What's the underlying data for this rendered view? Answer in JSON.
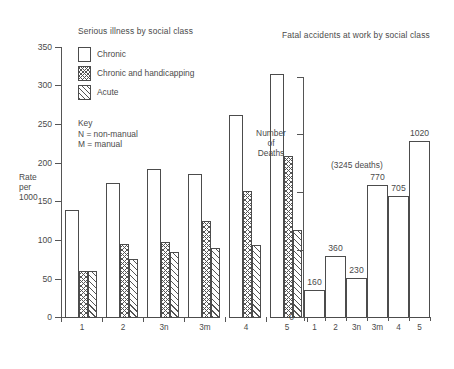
{
  "chart_data": [
    {
      "id": "serious-illness",
      "type": "bar",
      "title": "Serious illness by social class",
      "xlabel": "",
      "ylabel": "Rate per 1000",
      "ylim": [
        0,
        350
      ],
      "yticks": [
        0,
        50,
        100,
        150,
        200,
        250,
        300,
        350
      ],
      "categories": [
        "1",
        "2",
        "3n",
        "3m",
        "4",
        "5"
      ],
      "grid": false,
      "legend_position": "inside-top-left",
      "series": [
        {
          "name": "Chronic",
          "pattern": "white",
          "values": [
            139,
            173,
            191,
            185,
            261,
            314
          ]
        },
        {
          "name": "Chronic and handicapping",
          "pattern": "cross-hatch",
          "values": [
            61,
            95,
            98,
            124,
            163,
            208
          ]
        },
        {
          "name": "Acute",
          "pattern": "diagonal-hatch",
          "values": [
            60,
            75,
            84,
            89,
            93,
            113
          ]
        }
      ],
      "key_lines": [
        "Key",
        "N = non-manual",
        "M = manual"
      ]
    },
    {
      "id": "fatal-accidents",
      "type": "bar",
      "title": "Fatal accidents at work by social class",
      "xlabel": "",
      "ylabel": "Number of Deaths",
      "ylim": [
        0,
        1400
      ],
      "yticks": [
        0
      ],
      "categories": [
        "1",
        "2",
        "3n",
        "3m",
        "4",
        "5"
      ],
      "values": [
        160,
        360,
        230,
        770,
        705,
        1020
      ],
      "datalabels": [
        "160",
        "360",
        "230",
        "770",
        "705",
        "1020"
      ],
      "annotation": "(3245 deaths)",
      "grid": false
    }
  ],
  "left": {
    "title": "Serious illness by social class",
    "axis_title_lines": [
      "Rate",
      "per",
      "1000"
    ],
    "yticks": [
      "350",
      "300",
      "250",
      "200",
      "150",
      "100",
      "50",
      "0"
    ],
    "xlabels": [
      "1",
      "2",
      "3n",
      "3m",
      "4",
      "5"
    ],
    "legend": [
      {
        "label": "Chronic",
        "pattern": "white"
      },
      {
        "label": "Chronic and handicapping",
        "pattern": "cross"
      },
      {
        "label": "Acute",
        "pattern": "diag"
      }
    ],
    "key": "Key\nN = non-manual\nM = manual"
  },
  "right": {
    "title": "Fatal accidents at work by social class",
    "axis_title_lines": [
      "Number",
      "of",
      "Deaths"
    ],
    "annotation": "(3245 deaths)",
    "ytick_zero": "0",
    "xlabels": [
      "1",
      "2",
      "3n",
      "3m",
      "4",
      "5"
    ],
    "datalabels": [
      "160",
      "360",
      "230",
      "770",
      "705",
      "1020"
    ]
  }
}
